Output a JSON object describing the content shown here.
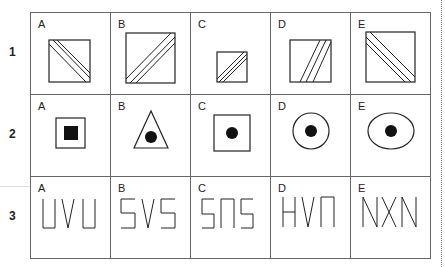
{
  "rows": [
    {
      "number": "1",
      "cells": [
        {
          "letter": "A",
          "figure": "small-square-diagonal-tl-br-triple-lines"
        },
        {
          "letter": "B",
          "figure": "large-square-diagonal-bl-tr-triple-lines"
        },
        {
          "letter": "C",
          "figure": "small-square-diagonal-bl-tr-triple-lines"
        },
        {
          "letter": "D",
          "figure": "square-steep-diagonal-triple-lines"
        },
        {
          "letter": "E",
          "figure": "large-square-diagonal-tl-br-triple-lines"
        }
      ]
    },
    {
      "number": "2",
      "cells": [
        {
          "letter": "A",
          "figure": "square-with-filled-square"
        },
        {
          "letter": "B",
          "figure": "triangle-with-filled-circle"
        },
        {
          "letter": "C",
          "figure": "square-with-filled-circle"
        },
        {
          "letter": "D",
          "figure": "circle-with-filled-circle"
        },
        {
          "letter": "E",
          "figure": "ellipse-with-filled-circle"
        }
      ]
    },
    {
      "number": "3",
      "cells": [
        {
          "letter": "A",
          "text": "UVU"
        },
        {
          "letter": "B",
          "text": "SVS"
        },
        {
          "letter": "C",
          "text": "SΠS"
        },
        {
          "letter": "D",
          "text": "HVΠ"
        },
        {
          "letter": "E",
          "text": "NXN"
        }
      ]
    }
  ],
  "colors": {
    "line": "#222222",
    "grid": "#666666"
  }
}
